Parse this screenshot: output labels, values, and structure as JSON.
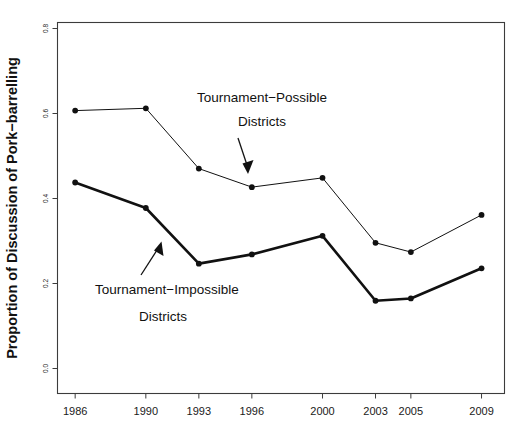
{
  "figure": {
    "background_color": "#ffffff",
    "ink_color": "#111111",
    "frame_color": "#3c3c3c"
  },
  "chart_data": {
    "type": "line",
    "title": "",
    "subtitle": "",
    "xlabel": "",
    "ylabel": "Proportion of Discussion of Pork−barrelling",
    "categories": [
      "1986",
      "1990",
      "1993",
      "1996",
      "2000",
      "2003",
      "2005",
      "2009"
    ],
    "x_numeric": [
      1986,
      1990,
      1993,
      1996,
      2000,
      2003,
      2005,
      2009
    ],
    "xlim": [
      1985.0,
      2010.3
    ],
    "ylim": [
      0.0,
      0.8
    ],
    "yticks": [
      0.0,
      0.2,
      0.4,
      0.6,
      0.8
    ],
    "ytick_labels": [
      "0.0",
      "0.2",
      "0.4",
      "0.6",
      "0.8"
    ],
    "xtick_labels": [
      "1986",
      "1990",
      "1993",
      "1996",
      "2000",
      "2003",
      "2005",
      "2009"
    ],
    "grid": false,
    "legend_position": "none",
    "series": [
      {
        "name": "Tournament−Possible Districts",
        "style": "thin",
        "values": [
          0.61,
          0.615,
          0.485,
          0.445,
          0.465,
          0.325,
          0.305,
          0.385
        ]
      },
      {
        "name": "Tournament−Impossible Districts",
        "style": "thick",
        "values": [
          0.455,
          0.4,
          0.28,
          0.3,
          0.34,
          0.2,
          0.205,
          0.27
        ]
      }
    ],
    "annotations": [
      {
        "id": "possible",
        "line1": "Tournament−Possible",
        "line2": "Districts",
        "arrow": "down-arrow-icon"
      },
      {
        "id": "impossible",
        "line1": "Tournament−Impossible",
        "line2": "Districts",
        "arrow": "up-arrow-icon"
      }
    ]
  }
}
